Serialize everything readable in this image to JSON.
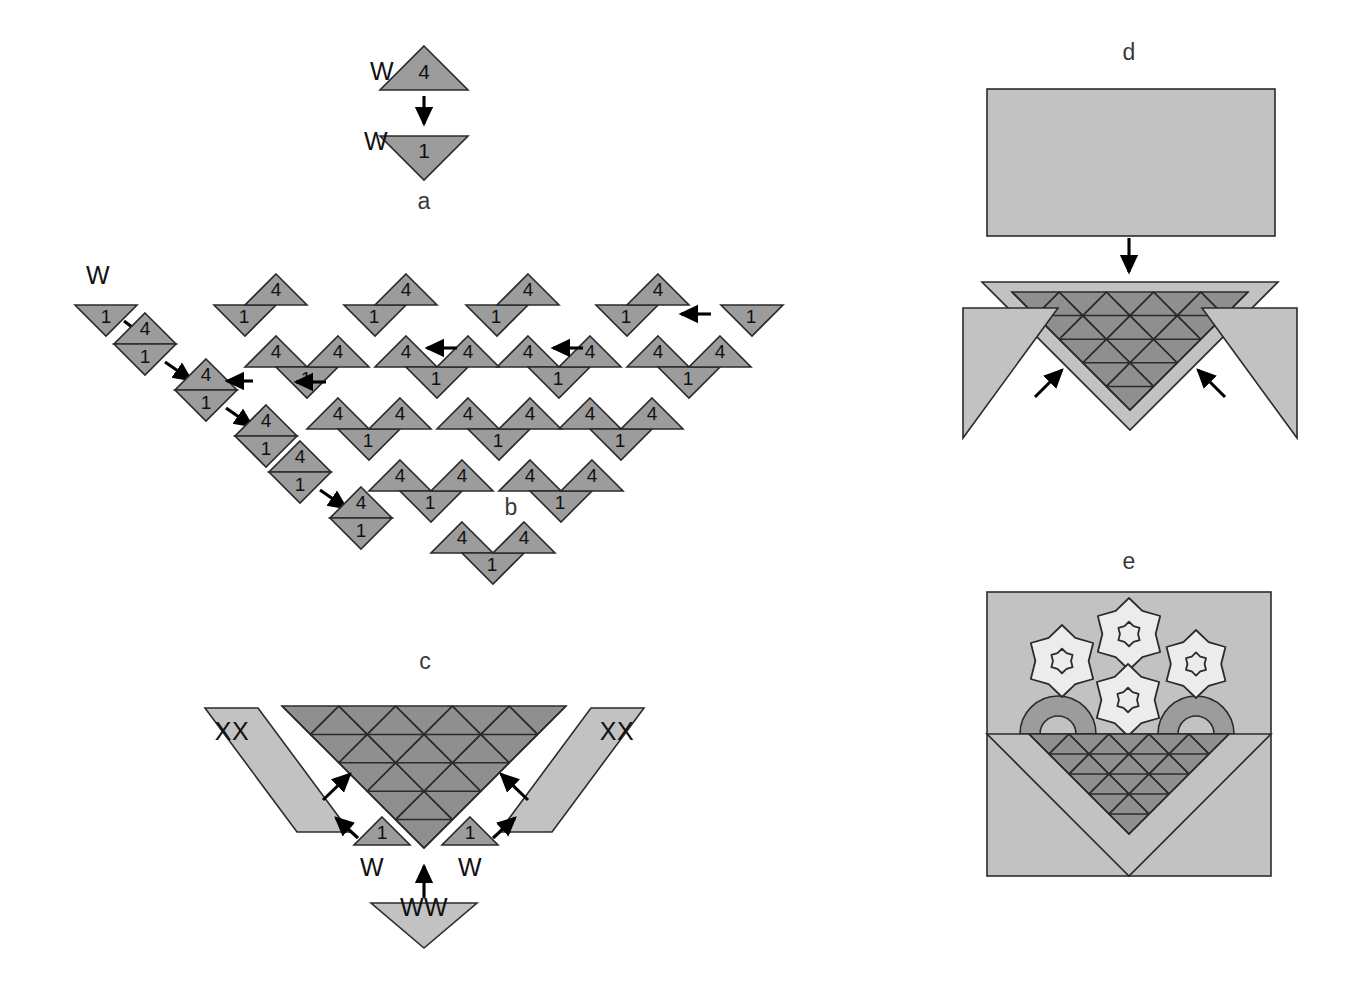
{
  "figure": {
    "background_color": "#ffffff",
    "palette": {
      "mid_gray": "#9c9c9c",
      "light_gray": "#c2c2c2",
      "dark_gray": "#8f8f8f",
      "flower_fill": "#ececec",
      "outline": "#2b2b2b",
      "label_color": "#3a3a3a"
    }
  },
  "panels": [
    {
      "id": "a",
      "label": "a",
      "label_x": 424,
      "label_y": 203
    },
    {
      "id": "b",
      "label": "b",
      "label_x": 511,
      "label_y": 509
    },
    {
      "id": "c",
      "label": "c",
      "label_x": 425,
      "label_y": 663
    },
    {
      "id": "d",
      "label": "d",
      "label_x": 1129,
      "label_y": 54
    },
    {
      "id": "e",
      "label": "e",
      "label_x": 1129,
      "label_y": 563
    }
  ],
  "panel_a": {
    "fabric_top": "W",
    "fabric_bottom": "W",
    "piece_top": "4",
    "piece_bottom": "1",
    "up_triangle": {
      "cx": 424,
      "cy": 90,
      "half_width": 44,
      "height": 44
    },
    "down_triangle": {
      "cx": 424,
      "cy": 136,
      "half_width": 44,
      "height": 44
    },
    "arrow": {
      "x1": 424,
      "y1": 96,
      "x2": 424,
      "y2": 124
    },
    "fabric_top_pos": {
      "x": 382,
      "y": 73
    },
    "fabric_bottom_pos": {
      "x": 376,
      "y": 143
    }
  },
  "panel_b": {
    "fabric_label": "W",
    "fabric_label_pos": {
      "x": 98,
      "y": 277
    },
    "piece_up": "4",
    "piece_down": "1",
    "unit_half_width": 31,
    "unit_height": 31,
    "seed_triangle": {
      "cx": 106,
      "cy": 305
    },
    "staircase": [
      {
        "cx": 145,
        "cy": 344
      },
      {
        "cx": 206,
        "cy": 390
      },
      {
        "cx": 266,
        "cy": 436
      },
      {
        "cx": 300,
        "cy": 472
      },
      {
        "cx": 361,
        "cy": 518
      }
    ],
    "strips": [
      {
        "top_cx": 752,
        "top_cy": 305,
        "units": 1
      },
      {
        "top_cx": 627,
        "top_cy": 305,
        "units": 2
      },
      {
        "top_cx": 497,
        "top_cy": 305,
        "units": 3
      },
      {
        "top_cx": 375,
        "top_cy": 305,
        "units": 4
      },
      {
        "top_cx": 245,
        "top_cy": 305,
        "units": 5
      }
    ],
    "flow_arrows": [
      {
        "x1": 711,
        "y1": 314,
        "x2": 681,
        "y2": 314,
        "dir": "left"
      },
      {
        "x1": 583,
        "y1": 348,
        "x2": 553,
        "y2": 348,
        "dir": "left"
      },
      {
        "x1": 457,
        "y1": 348,
        "x2": 427,
        "y2": 348,
        "dir": "left"
      },
      {
        "x1": 326,
        "y1": 382,
        "x2": 296,
        "y2": 382,
        "dir": "left"
      },
      {
        "x1": 253,
        "y1": 381,
        "x2": 227,
        "y2": 381,
        "dir": "left"
      }
    ]
  },
  "panel_c": {
    "fabric_strip_label": "XX",
    "fabric_small_label": "W",
    "fabric_bottom_label": "WW",
    "piece_small": "1",
    "triangle_rows": 5,
    "center_triangle": {
      "cx": 424,
      "cy": 706,
      "half_width": 142,
      "height": 142
    },
    "left_strip_label_pos": {
      "x": 232,
      "y": 733
    },
    "right_strip_label_pos": {
      "x": 617,
      "y": 733
    },
    "small_left": {
      "cx": 382,
      "cy": 845,
      "label_x": 372,
      "label_y": 869
    },
    "small_right": {
      "cx": 470,
      "cy": 845,
      "label_x": 470,
      "label_y": 869
    },
    "bottom_triangle": {
      "cx": 424,
      "cy": 903,
      "label_x": 424,
      "label_y": 909
    }
  },
  "panel_d": {
    "rectangle": {
      "x": 987,
      "y": 89,
      "width": 288,
      "height": 147
    },
    "arrow": {
      "x1": 1129,
      "y1": 238,
      "x2": 1129,
      "y2": 272
    },
    "center_triangle": {
      "cx": 1130,
      "cy": 282,
      "half_width": 148,
      "height": 148
    },
    "tile_triangle": {
      "cx": 1130,
      "cy": 292,
      "half_width": 118,
      "height": 118
    },
    "triangle_rows": 5,
    "left_corner": {
      "x": 963,
      "y": 308
    },
    "right_corner": {
      "x": 1297,
      "y": 308
    },
    "arrows_inward": [
      {
        "x1": 1035,
        "y1": 397,
        "x2": 1062,
        "y2": 370
      },
      {
        "x1": 1225,
        "y1": 397,
        "x2": 1198,
        "y2": 370
      }
    ]
  },
  "panel_e": {
    "square": {
      "x": 987,
      "y": 592,
      "width": 284,
      "height": 284
    },
    "basket": {
      "cx": 1129,
      "cy": 734,
      "half_width": 142,
      "height": 142
    },
    "tile_triangle": {
      "cx": 1129,
      "cy": 734,
      "half_width": 100,
      "height": 100
    },
    "triangle_rows": 5,
    "flowers": [
      {
        "cx": 1062,
        "cy": 661,
        "r": 36
      },
      {
        "cx": 1129,
        "cy": 634,
        "r": 36
      },
      {
        "cx": 1196,
        "cy": 664,
        "r": 34
      },
      {
        "cx": 1128,
        "cy": 700,
        "r": 36
      }
    ],
    "arcs": [
      {
        "cx": 1058,
        "cy": 734,
        "outer_r": 38,
        "inner_r": 18,
        "side": "left"
      },
      {
        "cx": 1196,
        "cy": 734,
        "outer_r": 38,
        "inner_r": 18,
        "side": "right"
      }
    ]
  }
}
